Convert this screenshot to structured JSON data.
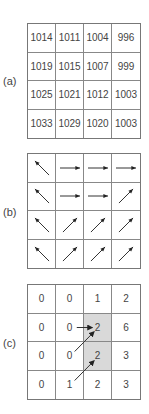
{
  "panels": [
    {
      "label": "(a)",
      "type": "elevation-values",
      "rows": [
        [
          "1014",
          "1011",
          "1004",
          "996"
        ],
        [
          "1019",
          "1015",
          "1007",
          "999"
        ],
        [
          "1025",
          "1021",
          "1012",
          "1003"
        ],
        [
          "1033",
          "1029",
          "1020",
          "1003"
        ]
      ]
    },
    {
      "label": "(b)",
      "type": "flow-directions",
      "rows": [
        [
          "NW",
          "E",
          "E",
          "E"
        ],
        [
          "NW",
          "E",
          "E",
          "NE"
        ],
        [
          "NW",
          "NE",
          "NE",
          "NE"
        ],
        [
          "NW",
          "NE",
          "NE",
          "NE"
        ]
      ]
    },
    {
      "label": "(c)",
      "type": "flow-accumulation",
      "rows": [
        [
          "0",
          "0",
          "1",
          "2"
        ],
        [
          "0",
          "0",
          "2",
          "6"
        ],
        [
          "0",
          "0",
          "2",
          "3"
        ],
        [
          "0",
          "1",
          "2",
          "3"
        ]
      ],
      "shaded_cells": [
        [
          1,
          2
        ],
        [
          2,
          2
        ]
      ],
      "shade_color": "#d9d9d9",
      "arrows": [
        {
          "from": [
            1,
            1
          ],
          "to": [
            1,
            2
          ]
        },
        {
          "from": [
            2,
            1
          ],
          "to": [
            1,
            2
          ]
        },
        {
          "from": [
            3,
            1
          ],
          "to": [
            2,
            2
          ]
        }
      ]
    }
  ]
}
